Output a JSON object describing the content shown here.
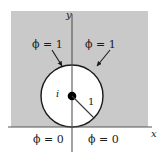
{
  "figure": {
    "type": "complex-plane-boundary-value-diagram",
    "colors": {
      "shaded_region": "#c9c9c9",
      "disk_region": "#ffffff",
      "page_background": "#ffffff",
      "stroke": "#1a1a1a",
      "axis": "#555555"
    },
    "axes": {
      "x_label": "x",
      "y_label": "y"
    },
    "point_label": "i",
    "radius_label": "1",
    "boundary_labels": {
      "upper_left": "ϕ = 1",
      "upper_right": "ϕ = 1",
      "lower_left": "ϕ = 0",
      "lower_right": "ϕ = 0"
    }
  },
  "geometry": {
    "origin_x": 72,
    "axis_y": 127,
    "circle_center_x": 72,
    "circle_center_y": 96,
    "circle_radius": 31
  }
}
